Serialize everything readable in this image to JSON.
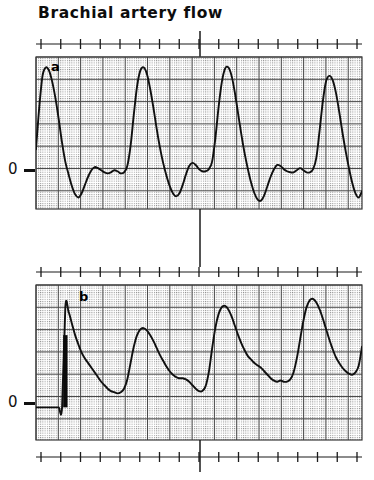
{
  "figure": {
    "title": "Brachial artery flow",
    "panels": [
      {
        "id": "a",
        "letter": "a",
        "zero_label": "0"
      },
      {
        "id": "b",
        "letter": "b",
        "zero_label": "0"
      }
    ]
  },
  "colors": {
    "trace": "#101010",
    "grid_major": "#4a4a4a",
    "grid_minor": "#9a9a9a",
    "frame": "#3a3a3a",
    "background": "#ffffff",
    "ruler": "#1a1a1a"
  },
  "chart_data": {
    "type": "line",
    "title": "Brachial artery flow",
    "xlabel": "",
    "ylabel": "",
    "grid": true,
    "legend_position": "none",
    "panels": [
      {
        "id": "a",
        "label": "a",
        "zero_label": "0",
        "zero_baseline": 0,
        "ylim": [
          -0.35,
          1.1
        ],
        "xlim": [
          0,
          100
        ],
        "description": "Sharp triphasic-like pulsatile flow: tall systolic spikes reaching near full scale with brief dips below the zero line in early diastole.",
        "x": [
          0,
          1,
          2,
          3,
          4,
          5,
          6,
          7,
          8,
          9,
          10,
          11,
          12,
          13,
          14,
          15,
          16,
          17,
          18,
          19,
          20,
          21,
          22,
          23,
          24,
          25,
          26,
          27,
          28,
          29,
          30,
          31,
          32,
          33,
          34,
          35,
          36,
          37,
          38,
          39,
          40,
          41,
          42,
          43,
          44,
          45,
          46,
          47,
          48,
          49,
          50,
          51,
          52,
          53,
          54,
          55,
          56,
          57,
          58,
          59,
          60,
          61,
          62,
          63,
          64,
          65,
          66,
          67,
          68,
          69,
          70,
          71,
          72,
          73,
          74,
          75,
          76,
          77,
          78,
          79,
          80,
          81,
          82,
          83,
          84,
          85,
          86,
          87,
          88,
          89,
          90,
          91,
          92,
          93,
          94,
          95,
          96,
          97,
          98,
          99,
          100
        ],
        "y": [
          0.22,
          0.62,
          0.92,
          1.0,
          0.97,
          0.86,
          0.7,
          0.5,
          0.28,
          0.1,
          -0.02,
          -0.13,
          -0.21,
          -0.24,
          -0.2,
          -0.12,
          -0.04,
          0.02,
          0.05,
          0.04,
          0.02,
          0.0,
          -0.01,
          0.0,
          0.02,
          0.01,
          -0.01,
          0.0,
          0.06,
          0.25,
          0.55,
          0.82,
          0.97,
          1.0,
          0.94,
          0.8,
          0.62,
          0.42,
          0.24,
          0.09,
          -0.03,
          -0.13,
          -0.2,
          -0.23,
          -0.2,
          -0.12,
          -0.02,
          0.06,
          0.09,
          0.07,
          0.03,
          0.01,
          0.01,
          0.03,
          0.1,
          0.32,
          0.62,
          0.86,
          0.99,
          1.0,
          0.92,
          0.76,
          0.56,
          0.36,
          0.18,
          0.03,
          -0.1,
          -0.2,
          -0.26,
          -0.27,
          -0.22,
          -0.13,
          -0.04,
          0.03,
          0.07,
          0.06,
          0.03,
          0.01,
          0.0,
          0.0,
          0.02,
          0.04,
          0.02,
          0.0,
          0.0,
          0.03,
          0.14,
          0.4,
          0.68,
          0.87,
          0.92,
          0.88,
          0.76,
          0.58,
          0.38,
          0.2,
          0.04,
          -0.1,
          -0.2,
          -0.24,
          -0.18,
          0.02
        ]
      },
      {
        "id": "b",
        "label": "b",
        "zero_label": "0",
        "zero_baseline": 0,
        "ylim": [
          -0.28,
          1.05
        ],
        "xlim": [
          0,
          100
        ],
        "description": "Damped, rounded monophasic pulses following a step calibration bar; flow stays at or above the zero baseline throughout.",
        "calibration_bar": {
          "x": 9,
          "from": 0.0,
          "to": 0.62
        },
        "x": [
          0,
          1,
          2,
          3,
          4,
          5,
          6,
          7,
          8,
          9,
          10,
          11,
          12,
          13,
          14,
          15,
          16,
          17,
          18,
          19,
          20,
          21,
          22,
          23,
          24,
          25,
          26,
          27,
          28,
          29,
          30,
          31,
          32,
          33,
          34,
          35,
          36,
          37,
          38,
          39,
          40,
          41,
          42,
          43,
          44,
          45,
          46,
          47,
          48,
          49,
          50,
          51,
          52,
          53,
          54,
          55,
          56,
          57,
          58,
          59,
          60,
          61,
          62,
          63,
          64,
          65,
          66,
          67,
          68,
          69,
          70,
          71,
          72,
          73,
          74,
          75,
          76,
          77,
          78,
          79,
          80,
          81,
          82,
          83,
          84,
          85,
          86,
          87,
          88,
          89,
          90,
          91,
          92,
          93,
          94,
          95,
          96,
          97,
          98,
          99,
          100
        ],
        "y": [
          0.0,
          0.0,
          0.0,
          0.0,
          0.0,
          0.0,
          0.0,
          0.0,
          0.0,
          0.86,
          0.82,
          0.72,
          0.62,
          0.54,
          0.47,
          0.42,
          0.38,
          0.34,
          0.3,
          0.26,
          0.22,
          0.19,
          0.16,
          0.14,
          0.13,
          0.12,
          0.13,
          0.16,
          0.24,
          0.38,
          0.52,
          0.62,
          0.67,
          0.68,
          0.66,
          0.62,
          0.57,
          0.51,
          0.45,
          0.4,
          0.35,
          0.31,
          0.28,
          0.26,
          0.25,
          0.25,
          0.24,
          0.22,
          0.19,
          0.16,
          0.14,
          0.14,
          0.18,
          0.3,
          0.5,
          0.68,
          0.8,
          0.86,
          0.87,
          0.84,
          0.78,
          0.7,
          0.62,
          0.55,
          0.49,
          0.44,
          0.41,
          0.38,
          0.36,
          0.34,
          0.31,
          0.28,
          0.25,
          0.23,
          0.22,
          0.23,
          0.22,
          0.22,
          0.24,
          0.3,
          0.42,
          0.58,
          0.74,
          0.86,
          0.92,
          0.93,
          0.9,
          0.84,
          0.76,
          0.67,
          0.58,
          0.5,
          0.43,
          0.38,
          0.34,
          0.31,
          0.29,
          0.28,
          0.3,
          0.36,
          0.52
        ]
      }
    ],
    "rulers": [
      {
        "id": "ruler-top",
        "tick_count": 16,
        "marker_index": 8
      },
      {
        "id": "ruler-bottom",
        "tick_count": 16,
        "marker_index": 8
      }
    ]
  }
}
